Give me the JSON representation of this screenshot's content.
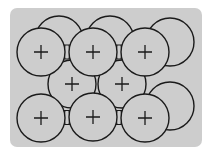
{
  "diagram": {
    "background": {
      "x": 10,
      "y": 8,
      "width": 192,
      "height": 139,
      "rx": 7,
      "color": "#cdcdcd"
    },
    "stroke_color": "#1a1a1a",
    "fill_color": "#cdcdcd",
    "radius": 24,
    "back_ions": [
      {
        "cx": 59,
        "cy": 40
      },
      {
        "cx": 110,
        "cy": 40
      },
      {
        "cx": 170,
        "cy": 42
      },
      {
        "cx": 170,
        "cy": 106
      }
    ],
    "middle_ions": [
      {
        "cx": 72,
        "cy": 84,
        "label": "+"
      },
      {
        "cx": 122,
        "cy": 84,
        "label": "+"
      }
    ],
    "front_ions": [
      {
        "cx": 41,
        "cy": 52,
        "label": "+"
      },
      {
        "cx": 93,
        "cy": 52,
        "label": "+"
      },
      {
        "cx": 145,
        "cy": 52,
        "label": "+"
      },
      {
        "cx": 41,
        "cy": 118,
        "label": "+"
      },
      {
        "cx": 93,
        "cy": 117,
        "label": "+"
      },
      {
        "cx": 145,
        "cy": 118,
        "label": "+"
      }
    ],
    "charge_symbol": "+"
  }
}
